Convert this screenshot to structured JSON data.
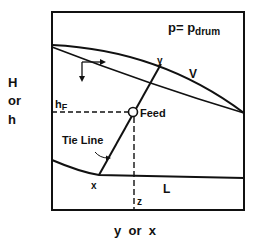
{
  "diagram": {
    "type": "enthalpy-composition flash diagram",
    "pressure_label": {
      "main": "p= p",
      "subscript": "drum"
    },
    "y_axis_label": [
      "H",
      "or",
      "h"
    ],
    "x_axis_label": "y  or  x",
    "curves": {
      "vapor": "V",
      "liquid": "L"
    },
    "points": {
      "vapor_composition": "y",
      "liquid_composition": "x",
      "feed_composition": "z",
      "feed_enthalpy": {
        "main": "h",
        "subscript": "F"
      }
    },
    "annotations": {
      "feed": "Feed",
      "tie_line": "Tie Line"
    },
    "colors": {
      "line": "#111111",
      "background": "#ffffff"
    }
  }
}
